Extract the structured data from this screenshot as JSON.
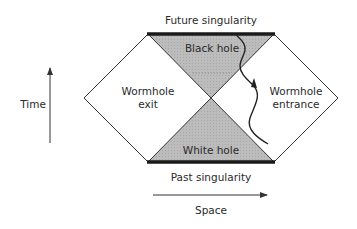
{
  "diagram": {
    "title_top": "Future singularity",
    "title_bottom": "Past singularity",
    "regions": {
      "black_hole": "Black hole",
      "white_hole": "White hole",
      "exit_line1": "Wormhole",
      "exit_line2": "exit",
      "entrance_line1": "Wormhole",
      "entrance_line2": "entrance"
    },
    "axes": {
      "time": "Time",
      "space": "Space"
    },
    "colors": {
      "shaded": "#b9b9b9",
      "singularity": "#1a1a1a",
      "line": "#333333"
    }
  }
}
